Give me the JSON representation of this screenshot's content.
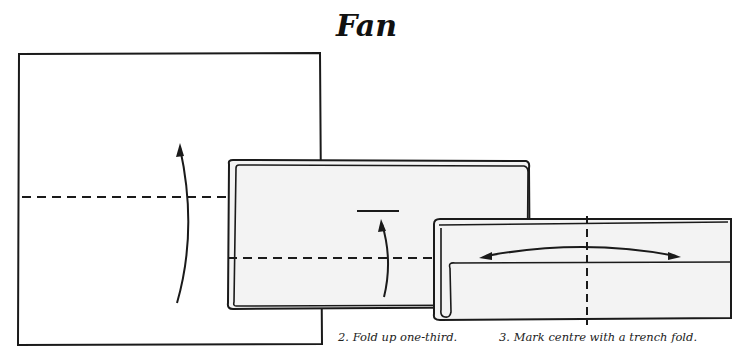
{
  "title": "Fan",
  "steps": [
    {
      "number": 1,
      "caption": "",
      "elements": [
        "square-sheet",
        "horizontal-fold-line",
        "fold-up-arrow"
      ]
    },
    {
      "number": 2,
      "caption": "2. Fold up one-third.",
      "elements": [
        "folded-rectangle",
        "fold-line",
        "fold-up-arrow",
        "target-line"
      ]
    },
    {
      "number": 3,
      "caption": "3. Mark centre with a trench fold.",
      "elements": [
        "folded-strip",
        "vertical-centre-fold-line",
        "double-headed-arrow"
      ]
    }
  ],
  "colors": {
    "line": "#1a1a1a",
    "paper": "#ffffff",
    "shaded_paper": "#f3f3f3"
  }
}
